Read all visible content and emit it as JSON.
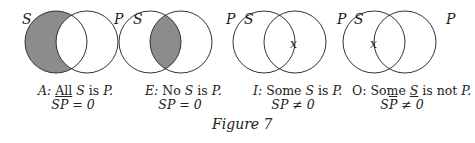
{
  "figure": {
    "caption": "Figure 7"
  },
  "labels": {
    "s": "S",
    "p": "P",
    "x": "x"
  },
  "diagrams": [
    {
      "id": "A",
      "prefix": "A:",
      "line1_a": "All",
      "line1_s": "S",
      "line1_is": "is",
      "line1_p": "P.",
      "formula_s": "S",
      "formula_p": "P",
      "formula_rest": "= 0",
      "shaded": "S-only"
    },
    {
      "id": "E",
      "prefix": "E:",
      "line1_a": "No",
      "line1_s": "S",
      "line1_is": "is",
      "line1_p": "P.",
      "formula_s": "S",
      "formula_p": "P",
      "formula_rest": "= 0",
      "shaded": "intersection"
    },
    {
      "id": "I",
      "prefix": "I:",
      "line1_a": "Some",
      "line1_s": "S",
      "line1_is": "is",
      "line1_p": "P.",
      "formula_s": "S",
      "formula_p": "P",
      "formula_rest": "≠ 0",
      "mark": "intersection"
    },
    {
      "id": "O",
      "prefix": "O:",
      "line1_a": "Some",
      "line1_s": "S",
      "line1_is": "is not",
      "line1_p": "P.",
      "formula_s": "S",
      "formula_p": "P",
      "formula_rest": "≠ 0",
      "mark": "S-only"
    }
  ],
  "colors": {
    "shade": "#8c8c8c",
    "stroke": "#333333"
  }
}
